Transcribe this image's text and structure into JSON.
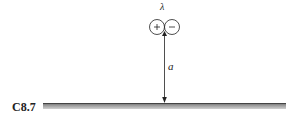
{
  "figure": {
    "id_label": "C8.7",
    "strength_label": "λ",
    "distance_label": "a",
    "source_sign": "+",
    "sink_sign": "−",
    "colors": {
      "ink": "#222222",
      "wall_dark": "#6a6a6a",
      "wall_light": "#d0d0d0"
    }
  }
}
